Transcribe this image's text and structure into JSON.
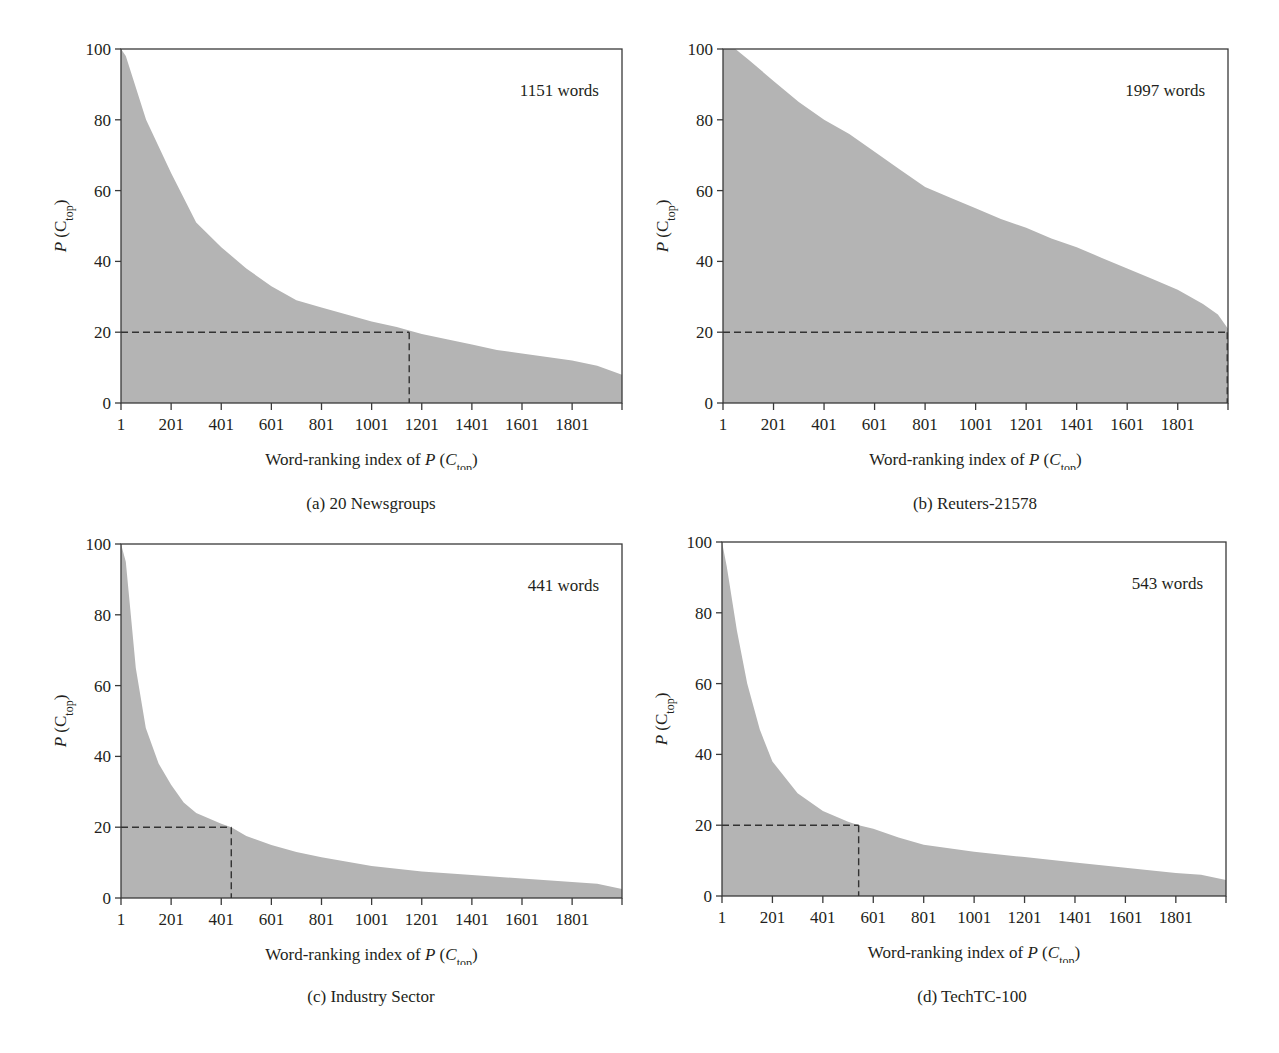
{
  "figure": {
    "fill_color": "#b4b4b4",
    "axis_color": "#3a3a3a",
    "dash_color": "#333333",
    "panels": [
      {
        "id": "a",
        "caption": "(a)  20 Newsgroups",
        "annotation": "1151 words",
        "ylabel": "P (C_top)",
        "xlabel": "Word-ranking index of P (C_top)",
        "threshold_y": 20,
        "threshold_x": 1151
      },
      {
        "id": "b",
        "caption": "(b)  Reuters-21578",
        "annotation": "1997 words",
        "ylabel": "P (C_top)",
        "xlabel": "Word-ranking index of P (C_top)",
        "threshold_y": 20,
        "threshold_x": 1997
      },
      {
        "id": "c",
        "caption": "(c)  Industry Sector",
        "annotation": "441 words",
        "ylabel": "P (C_top)",
        "xlabel": "Word-ranking index of P (C_top)",
        "threshold_y": 20,
        "threshold_x": 441
      },
      {
        "id": "d",
        "caption": "(d)  TechTC-100",
        "annotation": "543 words",
        "ylabel": "P (C_top)",
        "xlabel": "Word-ranking index of P (C_top)",
        "threshold_y": 20,
        "threshold_x": 543
      }
    ]
  },
  "chart_data": [
    {
      "type": "area",
      "title": "(a) 20 Newsgroups",
      "annotation": "1151 words",
      "xlabel": "Word-ranking index of P (C_top)",
      "ylabel": "P (C_top)",
      "xlim": [
        1,
        2000
      ],
      "ylim": [
        0,
        100
      ],
      "xticks": [
        "1",
        "201",
        "401",
        "601",
        "801",
        "1001",
        "1201",
        "1401",
        "1601",
        "1801"
      ],
      "yticks": [
        "0",
        "20",
        "40",
        "60",
        "80",
        "100"
      ],
      "grid": false,
      "reference_lines": {
        "y": 20,
        "x": 1151,
        "style": "dashed"
      },
      "x": [
        1,
        20,
        101,
        201,
        301,
        401,
        501,
        601,
        701,
        801,
        901,
        1001,
        1101,
        1151,
        1201,
        1301,
        1401,
        1501,
        1601,
        1701,
        1801,
        1901,
        2000
      ],
      "values": [
        100,
        98,
        80,
        65,
        51,
        44,
        38,
        33,
        29,
        27,
        25,
        23,
        21.5,
        20.5,
        19.5,
        18,
        16.5,
        15,
        14,
        13,
        12,
        10.5,
        8
      ]
    },
    {
      "type": "area",
      "title": "(b) Reuters-21578",
      "annotation": "1997 words",
      "xlabel": "Word-ranking index of P (C_top)",
      "ylabel": "P (C_top)",
      "xlim": [
        1,
        2000
      ],
      "ylim": [
        0,
        100
      ],
      "xticks": [
        "1",
        "201",
        "401",
        "601",
        "801",
        "1001",
        "1201",
        "1401",
        "1601",
        "1801"
      ],
      "yticks": [
        "0",
        "20",
        "40",
        "60",
        "80",
        "100"
      ],
      "grid": false,
      "reference_lines": {
        "y": 20,
        "x": 1997,
        "style": "dashed"
      },
      "x": [
        1,
        50,
        101,
        201,
        301,
        401,
        501,
        601,
        701,
        801,
        901,
        1001,
        1101,
        1201,
        1301,
        1401,
        1501,
        1601,
        1701,
        1801,
        1901,
        1960,
        2000
      ],
      "values": [
        100,
        100,
        97,
        91,
        85,
        80,
        76,
        71,
        66,
        61,
        58,
        55,
        52,
        49.5,
        46.5,
        44,
        41,
        38,
        35,
        32,
        28,
        25,
        21
      ]
    },
    {
      "type": "area",
      "title": "(c) Industry Sector",
      "annotation": "441 words",
      "xlabel": "Word-ranking index of P (C_top)",
      "ylabel": "P (C_top)",
      "xlim": [
        1,
        2000
      ],
      "ylim": [
        0,
        100
      ],
      "xticks": [
        "1",
        "201",
        "401",
        "601",
        "801",
        "1001",
        "1201",
        "1401",
        "1601",
        "1801"
      ],
      "yticks": [
        "0",
        "20",
        "40",
        "60",
        "80",
        "100"
      ],
      "grid": false,
      "reference_lines": {
        "y": 20,
        "x": 441,
        "style": "dashed"
      },
      "x": [
        1,
        20,
        40,
        60,
        100,
        151,
        201,
        251,
        301,
        401,
        441,
        501,
        601,
        701,
        801,
        1001,
        1201,
        1401,
        1601,
        1801,
        1901,
        2000
      ],
      "values": [
        100,
        95,
        80,
        65,
        48,
        38,
        32,
        27,
        24,
        21,
        20,
        17.5,
        15,
        13,
        11.5,
        9,
        7.5,
        6.5,
        5.5,
        4.5,
        4,
        2.5
      ]
    },
    {
      "type": "area",
      "title": "(d) TechTC-100",
      "annotation": "543 words",
      "xlabel": "Word-ranking index of P (C_top)",
      "ylabel": "P (C_top)",
      "xlim": [
        1,
        2000
      ],
      "ylim": [
        0,
        100
      ],
      "xticks": [
        "1",
        "201",
        "401",
        "601",
        "801",
        "1001",
        "1201",
        "1401",
        "1601",
        "1801"
      ],
      "yticks": [
        "0",
        "20",
        "40",
        "60",
        "80",
        "100"
      ],
      "grid": false,
      "reference_lines": {
        "y": 20,
        "x": 543,
        "style": "dashed"
      },
      "x": [
        1,
        20,
        60,
        101,
        151,
        201,
        301,
        401,
        501,
        543,
        601,
        701,
        801,
        1001,
        1201,
        1401,
        1601,
        1801,
        1901,
        2000
      ],
      "values": [
        100,
        93,
        75,
        60,
        47,
        38,
        29,
        24,
        21,
        20,
        19,
        16.5,
        14.5,
        12.5,
        11,
        9.5,
        8,
        6.5,
        6,
        4.5
      ]
    }
  ]
}
